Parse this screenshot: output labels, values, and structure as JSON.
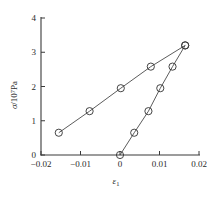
{
  "chart_data": {
    "type": "line",
    "title": "",
    "subtitle": "",
    "xlabel": "ε₁",
    "xlabel_symbol": "ε",
    "xlabel_subscript": "1",
    "ylabel": "σ/10⁷Pa",
    "ylabel_symbol": "σ",
    "ylabel_divider": "/10",
    "ylabel_exponent": "7",
    "ylabel_unit": "Pa",
    "xlim": [
      -0.02,
      0.02
    ],
    "ylim": [
      0,
      4
    ],
    "xticks": [
      -0.02,
      -0.01,
      0,
      0.01,
      0.02
    ],
    "xticklabels": [
      "−0.02",
      "−0.01",
      "0",
      "0.01",
      "0.02"
    ],
    "yticks": [
      0,
      1,
      2,
      3,
      4
    ],
    "yticklabels": [
      "0",
      "1",
      "2",
      "3",
      "4"
    ],
    "grid": false,
    "legend": "none",
    "marker": "open-circle",
    "series": [
      {
        "name": "series-upper-left",
        "x": [
          -0.0155,
          -0.0077,
          0.0002,
          0.0078,
          0.0165
        ],
        "y": [
          0.65,
          1.28,
          1.95,
          2.58,
          3.2
        ]
      },
      {
        "name": "series-lower-right",
        "x": [
          0.0,
          0.0036,
          0.0072,
          0.0102,
          0.0133,
          0.0165
        ],
        "y": [
          0.0,
          0.65,
          1.28,
          1.95,
          2.58,
          3.2
        ]
      }
    ]
  },
  "figure": {
    "plot_area": {
      "x_pixel_min": 41,
      "x_pixel_max": 199,
      "y_pixel_min": 18,
      "y_pixel_max": 155
    }
  }
}
